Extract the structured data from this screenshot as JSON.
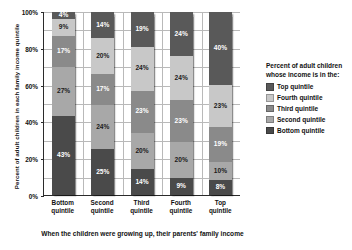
{
  "chart_data": {
    "type": "bar",
    "subtype": "stacked-percent-column",
    "title": "",
    "xlabel": "When the children were growing up, their parents' family income",
    "ylabel": "Percent of adult children in each family income quintile",
    "categories": [
      "Bottom quintile",
      "Second quintile",
      "Third quintile",
      "Fourth quintile",
      "Top quintile"
    ],
    "ylim": [
      0,
      100
    ],
    "ytick_labels": [
      "0%",
      "20%",
      "40%",
      "60%",
      "80%",
      "100%"
    ],
    "ytick_values": [
      0,
      20,
      40,
      60,
      80,
      100
    ],
    "grid": true,
    "legend_position": "right",
    "legend_title": "Percent of adult children whose income is in the:",
    "stack_order_top_to_bottom": [
      "Top quintile",
      "Fourth quintile",
      "Third quintile",
      "Second quintile",
      "Bottom quintile"
    ],
    "series": [
      {
        "name": "Top quintile",
        "color": "#595959",
        "values": [
          4,
          14,
          19,
          24,
          40
        ],
        "labels": [
          "4%",
          "14%",
          "19%",
          "24%",
          "40%"
        ]
      },
      {
        "name": "Fourth quintile",
        "color": "#c8c8c8",
        "values": [
          9,
          20,
          24,
          24,
          23
        ],
        "labels": [
          "9%",
          "20%",
          "24%",
          "24%",
          "23%"
        ]
      },
      {
        "name": "Third quintile",
        "color": "#8a8a8a",
        "values": [
          17,
          17,
          23,
          23,
          19
        ],
        "labels": [
          "17%",
          "17%",
          "23%",
          "23%",
          "19%"
        ]
      },
      {
        "name": "Second quintile",
        "color": "#a8a8a8",
        "values": [
          27,
          24,
          20,
          20,
          10
        ],
        "labels": [
          "27%",
          "24%",
          "20%",
          "20%",
          "10%"
        ]
      },
      {
        "name": "Bottom quintile",
        "color": "#4a4a4a",
        "values": [
          43,
          25,
          14,
          9,
          8
        ],
        "labels": [
          "43%",
          "25%",
          "14%",
          "9%",
          "8%"
        ]
      }
    ]
  },
  "legend": {
    "title": "Percent of adult children whose income is in the:",
    "items": [
      {
        "label": "Top quintile",
        "color": "#595959"
      },
      {
        "label": "Fourth quintile",
        "color": "#c8c8c8"
      },
      {
        "label": "Third quintile",
        "color": "#8a8a8a"
      },
      {
        "label": "Second quintile",
        "color": "#a8a8a8"
      },
      {
        "label": "Bottom quintile",
        "color": "#4a4a4a"
      }
    ]
  },
  "axes": {
    "y_title": "Percent of adult children in each family income quintile",
    "x_title": "When the children were growing up, their parents' family income"
  }
}
